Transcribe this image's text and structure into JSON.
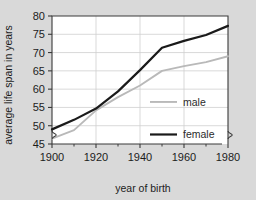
{
  "chart_data": {
    "type": "line",
    "title": "",
    "xlabel": "year of birth",
    "ylabel": "average life span in years",
    "xlim": [
      1900,
      1980
    ],
    "ylim": [
      45,
      80
    ],
    "xticks": [
      1900,
      1920,
      1940,
      1960,
      1980
    ],
    "xtick_labels": [
      "1900",
      "1920",
      "1940",
      "1960",
      "1980"
    ],
    "xminorticks": [
      1910,
      1930,
      1950,
      1970
    ],
    "yticks": [
      45,
      50,
      55,
      60,
      65,
      70,
      75,
      80
    ],
    "ytick_labels": [
      "45",
      "50",
      "55",
      "60",
      "65",
      "70",
      "75",
      "80"
    ],
    "grid": true,
    "axis_break": true,
    "legend_position": "inside-right",
    "x": [
      1900,
      1910,
      1920,
      1930,
      1940,
      1950,
      1960,
      1970,
      1980
    ],
    "series": [
      {
        "name": "male",
        "label": "male",
        "color": "#b9b9b9",
        "values": [
          46.5,
          48.8,
          54.2,
          57.8,
          61.0,
          65.0,
          66.3,
          67.4,
          69.0
        ]
      },
      {
        "name": "female",
        "label": "female",
        "color": "#1a1a1a",
        "values": [
          49.0,
          51.6,
          54.7,
          59.4,
          65.2,
          71.3,
          73.2,
          74.8,
          77.3
        ]
      }
    ]
  },
  "colors": {
    "background": "#d9d9d9",
    "plot_background": "#ffffff",
    "grid": "#cfcfcf",
    "axis": "#3a3a3a",
    "text": "#1c1c1c"
  }
}
